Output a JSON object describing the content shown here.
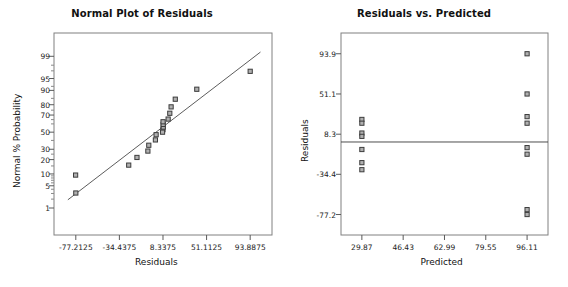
{
  "figure": {
    "width": 568,
    "height": 287,
    "background": "#ffffff",
    "marker_fill": "#b0b0b0",
    "marker_stroke": "#3c3c3c",
    "line_color": "#4a4a4a",
    "frame_color": "#808080"
  },
  "chart_data": [
    {
      "type": "scatter",
      "id": "normal-plot-of-residuals",
      "title": "Normal Plot of Residuals",
      "xlabel": "Residuals",
      "ylabel": "Normal % Probability",
      "grid": false,
      "legend": null,
      "xlim": [
        -98.6,
        115.3
      ],
      "xticks": [
        -77.2125,
        -34.4375,
        8.3375,
        51.1125,
        93.8875
      ],
      "xtick_labels": [
        "-77.2125",
        "-34.4375",
        "8.3375",
        "51.1125",
        "93.8875"
      ],
      "yscale": "normal-probability",
      "yticks": [
        1,
        5,
        10,
        20,
        30,
        50,
        70,
        80,
        90,
        95,
        99
      ],
      "ytick_labels": [
        "1",
        "5",
        "10",
        "20",
        "30",
        "50",
        "70",
        "80",
        "90",
        "95",
        "99"
      ],
      "points": [
        {
          "x": -77.2,
          "y": 3.1
        },
        {
          "x": -77.4,
          "y": 9.4
        },
        {
          "x": -25.3,
          "y": 15.6
        },
        {
          "x": -17.2,
          "y": 21.9
        },
        {
          "x": -6.5,
          "y": 28.1
        },
        {
          "x": -5.6,
          "y": 34.4
        },
        {
          "x": 0.9,
          "y": 40.6
        },
        {
          "x": 1.6,
          "y": 46.9
        },
        {
          "x": 8.3,
          "y": 53.1
        },
        {
          "x": 8.6,
          "y": 56.2
        },
        {
          "x": 8.5,
          "y": 59.4
        },
        {
          "x": 7.9,
          "y": 50.0
        },
        {
          "x": 8.4,
          "y": 62.5
        },
        {
          "x": 13.4,
          "y": 65.6
        },
        {
          "x": 15.0,
          "y": 71.9
        },
        {
          "x": 16.3,
          "y": 78.1
        },
        {
          "x": 20.4,
          "y": 84.4
        },
        {
          "x": 41.5,
          "y": 90.6
        },
        {
          "x": 93.9,
          "y": 96.9
        }
      ],
      "reference_line": {
        "x1": -85.0,
        "y1": 1.9,
        "x2": 104.0,
        "y2": 99.3
      }
    },
    {
      "type": "scatter",
      "id": "residuals-vs-predicted",
      "title": "Residuals vs. Predicted",
      "xlabel": "Predicted",
      "ylabel": "Residuals",
      "grid": false,
      "legend": null,
      "xlim": [
        21.5,
        104.5
      ],
      "xticks": [
        29.87,
        46.43,
        62.99,
        79.55,
        96.11
      ],
      "xtick_labels": [
        "29.87",
        "46.43",
        "62.99",
        "79.55",
        "96.11"
      ],
      "ylim": [
        -99.0,
        116.0
      ],
      "yticks": [
        93.9,
        51.1,
        8.3,
        -34.4,
        -77.2
      ],
      "ytick_labels": [
        "93.9",
        "51.1",
        "8.3",
        "-34.4",
        "-77.2"
      ],
      "zero_line": 0.0,
      "points": [
        {
          "x": 29.87,
          "y": 24.0
        },
        {
          "x": 29.87,
          "y": 20.0
        },
        {
          "x": 29.87,
          "y": 9.5
        },
        {
          "x": 29.87,
          "y": 6.0
        },
        {
          "x": 29.87,
          "y": -8.0
        },
        {
          "x": 29.87,
          "y": -22.0
        },
        {
          "x": 29.87,
          "y": -29.5
        },
        {
          "x": 96.11,
          "y": 93.9
        },
        {
          "x": 96.11,
          "y": 51.1
        },
        {
          "x": 96.11,
          "y": 27.0
        },
        {
          "x": 96.11,
          "y": 20.0
        },
        {
          "x": 96.11,
          "y": -6.0
        },
        {
          "x": 96.11,
          "y": -13.0
        },
        {
          "x": 96.11,
          "y": -72.0
        },
        {
          "x": 96.11,
          "y": -77.2
        }
      ]
    }
  ]
}
